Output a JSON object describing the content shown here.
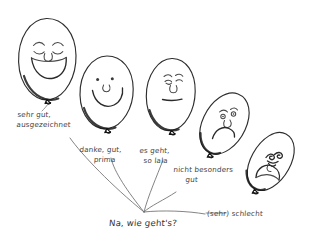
{
  "drawing": {
    "title": "Na, wie geht's?",
    "question": "Na, wie geht's?",
    "style": "hand-drawn pencil sketch of five balloon faces on white background",
    "ink_color": "#3b3b3b",
    "background_color": "#ffffff",
    "balloons": [
      {
        "id": "balloon-1",
        "mood": "very-happy",
        "face": "closed curved smiling eyes, round nose, wide open smile",
        "label_line1": "sehr gut,",
        "label_line2": "ausgezeichnet"
      },
      {
        "id": "balloon-2",
        "mood": "happy",
        "face": "two dot eyes, small round nose, curved smile",
        "label_line1": "danke, gut,",
        "label_line2": "prima"
      },
      {
        "id": "balloon-3",
        "mood": "neutral",
        "face": "small squinting eyes, nose, straight flat mouth",
        "label_line1": "es geht,",
        "label_line2": "so lala"
      },
      {
        "id": "balloon-4",
        "mood": "unhappy",
        "face": "worried eyes with brows, nose, downturned frown",
        "label_line1": "nicht besonders",
        "label_line2": "gut"
      },
      {
        "id": "balloon-5",
        "mood": "very-unhappy",
        "face": "scribbled screwed-up eyes, deep large frown",
        "label_line1": "(sehr) schlecht",
        "label_line2": ""
      }
    ]
  }
}
